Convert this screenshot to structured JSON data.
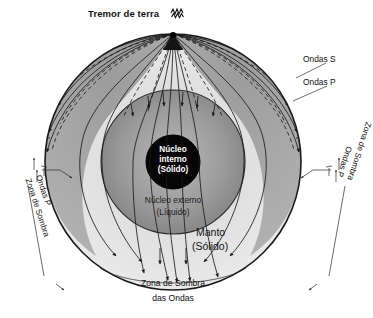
{
  "figure": {
    "title": "Tremor de terra",
    "title_icon": "seismogram-squiggle-icon"
  },
  "labels": {
    "focus": "Tremor de terra",
    "waves_s": "Ondas S",
    "waves_p": "Ondas P",
    "inner_core_l1": "Núcleo",
    "inner_core_l2": "interno",
    "inner_core_l3": "(Sólido)",
    "outer_core_l1": "Núcleo externo",
    "outer_core_l2": "(Líquido)",
    "mantle_l1": "Manto",
    "mantle_l2": "(Sólido)",
    "shadow_left_p": "Ondas P",
    "shadow_left_zone": "Zona de Sombra",
    "shadow_right_p": "Ondas P",
    "shadow_right_zone": "Zona de Sombra",
    "bottom_l1": "Zona de Sombra",
    "bottom_l2": "das Ondas"
  },
  "colors": {
    "background": "#ffffff",
    "outline": "#1b1b1b",
    "upper_mantle_band": "#a9a9a9",
    "lower_mantle": "#e2e2e2",
    "outer_core": "#8f8f8f",
    "inner_core": "#060606",
    "text": "#111111",
    "text_on_core": "#ffffff",
    "ray_solid": "#1b1b1b",
    "ray_dashed": "#1b1b1b"
  },
  "geometry": {
    "earth_center_x": 173,
    "earth_center_y": 162,
    "earth_radius": 128,
    "outer_core_radius": 72,
    "inner_core_radius": 27,
    "focus_x": 173,
    "focus_y": 34
  },
  "legend": [
    {
      "name": "s-waves",
      "label": "Ondas S",
      "style": "dashed"
    },
    {
      "name": "p-waves",
      "label": "Ondas P",
      "style": "solid"
    }
  ]
}
